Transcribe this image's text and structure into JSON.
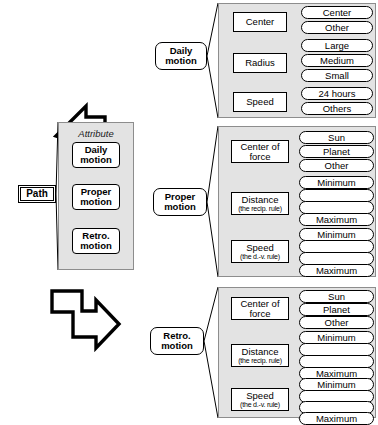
{
  "root": {
    "label": "Path"
  },
  "attribute_panel": {
    "title": "Attribute",
    "items": [
      {
        "label": "Daily\nmotion"
      },
      {
        "label": "Proper\nmotion"
      },
      {
        "label": "Retro.\nmotion"
      }
    ]
  },
  "arrows": [
    {
      "name": "arrow-to-daily-motion",
      "direction": "up-right"
    },
    {
      "name": "arrow-to-proper-motion",
      "direction": "right"
    },
    {
      "name": "arrow-to-retro-motion",
      "direction": "down-right"
    }
  ],
  "branches": [
    {
      "id": "daily",
      "node_label": "Daily\nmotion",
      "groups": [
        {
          "name": "Center",
          "sub": "",
          "values": [
            "Center",
            "Other"
          ]
        },
        {
          "name": "Radius",
          "sub": "",
          "values": [
            "Large",
            "Medium",
            "Small"
          ]
        },
        {
          "name": "Speed",
          "sub": "",
          "values": [
            "24 hours",
            "Others"
          ]
        }
      ],
      "linked_pair": false
    },
    {
      "id": "proper",
      "node_label": "Proper\nmotion",
      "groups": [
        {
          "name": "Center of\nforce",
          "sub": "",
          "values": [
            "Sun",
            "Planet",
            "Other"
          ]
        },
        {
          "name": "Distance",
          "sub": "(the recip. rule)",
          "values": [
            "Minimum",
            "",
            "",
            "Maximum"
          ]
        },
        {
          "name": "Speed",
          "sub": "(the d.-v. rule)",
          "values": [
            "Minimum",
            "",
            "",
            "Maximum"
          ]
        }
      ],
      "linked_pair": true
    },
    {
      "id": "retro",
      "node_label": "Retro.\nmotion",
      "groups": [
        {
          "name": "Center of\nforce",
          "sub": "",
          "values": [
            "Sun",
            "Planet",
            "Other"
          ]
        },
        {
          "name": "Distance",
          "sub": "(the recip. rule)",
          "values": [
            "Minimum",
            "",
            "",
            "Maximum"
          ]
        },
        {
          "name": "Speed",
          "sub": "(the d.-v. rule)",
          "values": [
            "Minimum",
            "",
            "",
            "Maximum"
          ]
        }
      ],
      "linked_pair": true
    }
  ],
  "colors": {
    "panel_fill": "#e3e3e3",
    "panel_stroke": "#8d8d8d",
    "line": "#000000",
    "background": "#ffffff"
  }
}
